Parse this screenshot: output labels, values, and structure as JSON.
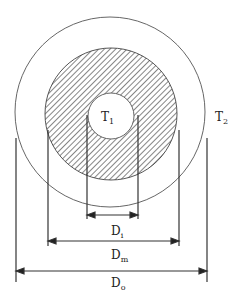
{
  "diagram": {
    "labels": {
      "inner_temp": "T",
      "inner_temp_sub": "1",
      "outer_temp": "T",
      "outer_temp_sub": "2",
      "inner_diameter": "D",
      "inner_diameter_sub": "i",
      "middle_diameter": "D",
      "middle_diameter_sub": "m",
      "outer_diameter": "D",
      "outer_diameter_sub": "o"
    },
    "colors": {
      "stroke": "#333333",
      "hatch": "#444444",
      "background": "#ffffff"
    }
  }
}
